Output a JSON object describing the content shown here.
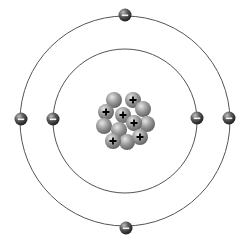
{
  "diagram": {
    "type": "bohr-atom-model",
    "canvas": {
      "width": 243,
      "height": 246,
      "background": "#ffffff"
    },
    "center": {
      "x": 125,
      "y": 121
    },
    "orbits": [
      {
        "name": "inner-orbit",
        "r": 72,
        "stroke": "#555555"
      },
      {
        "name": "outer-orbit",
        "r": 105,
        "stroke": "#555555"
      }
    ],
    "electrons": [
      {
        "name": "electron-outer-top",
        "x": 125,
        "y": 15,
        "symbol": "−"
      },
      {
        "name": "electron-outer-bottom",
        "x": 126,
        "y": 228,
        "symbol": "−"
      },
      {
        "name": "electron-outer-left",
        "x": 21,
        "y": 119,
        "symbol": "−"
      },
      {
        "name": "electron-outer-right",
        "x": 229,
        "y": 118,
        "symbol": "−"
      },
      {
        "name": "electron-inner-left",
        "x": 53,
        "y": 119,
        "symbol": "−"
      },
      {
        "name": "electron-inner-right",
        "x": 197,
        "y": 118,
        "symbol": "−"
      }
    ],
    "electron_radius": 6.5,
    "nucleus": {
      "particle_radius": 8,
      "particles": [
        {
          "kind": "neutron",
          "x": 114,
          "y": 100
        },
        {
          "kind": "proton",
          "x": 133,
          "y": 100,
          "symbol": "+"
        },
        {
          "kind": "neutron",
          "x": 143,
          "y": 109
        },
        {
          "kind": "proton",
          "x": 106,
          "y": 112,
          "symbol": "+"
        },
        {
          "kind": "neutron",
          "x": 147,
          "y": 124
        },
        {
          "kind": "proton",
          "x": 123,
          "y": 115,
          "symbol": "+"
        },
        {
          "kind": "neutron",
          "x": 104,
          "y": 126
        },
        {
          "kind": "proton",
          "x": 134,
          "y": 123,
          "symbol": "+"
        },
        {
          "kind": "neutron",
          "x": 119,
          "y": 130
        },
        {
          "kind": "neutron",
          "x": 127,
          "y": 142
        },
        {
          "kind": "proton",
          "x": 140,
          "y": 137,
          "symbol": "+"
        },
        {
          "kind": "proton",
          "x": 113,
          "y": 141,
          "symbol": "+"
        }
      ]
    },
    "counts": {
      "protons": 6,
      "neutrons": 6,
      "electrons": 6
    }
  }
}
